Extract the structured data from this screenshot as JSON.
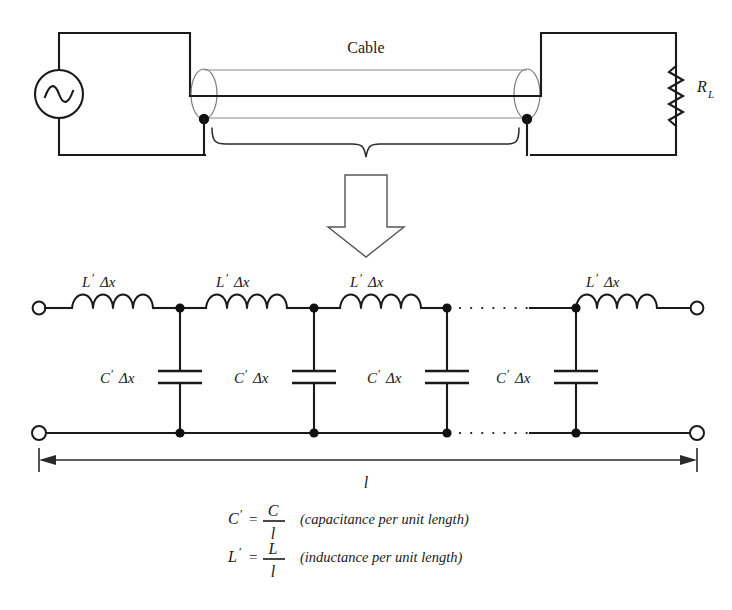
{
  "figure": {
    "title_top": "Cable"
  },
  "top_circuit": {
    "cable_label": "Cable",
    "source_name": "ac-source",
    "load_label_main": "R",
    "load_label_sub": "L"
  },
  "ladder": {
    "inductor_labels": [
      {
        "symbol": "L",
        "prime": "′",
        "delta": "Δx"
      },
      {
        "symbol": "L",
        "prime": "′",
        "delta": "Δx"
      },
      {
        "symbol": "L",
        "prime": "′",
        "delta": "Δx"
      },
      {
        "symbol": "L",
        "prime": "′",
        "delta": "Δx"
      }
    ],
    "capacitor_labels": [
      {
        "symbol": "C",
        "prime": "′",
        "delta": "Δx"
      },
      {
        "symbol": "C",
        "prime": "′",
        "delta": "Δx"
      },
      {
        "symbol": "C",
        "prime": "′",
        "delta": "Δx"
      },
      {
        "symbol": "C",
        "prime": "′",
        "delta": "Δx"
      }
    ],
    "length_label": "l"
  },
  "equations": [
    {
      "lhs_symbol": "C",
      "lhs_prime": "′",
      "equals": "=",
      "numerator": "C",
      "denominator": "l",
      "note": "(capacitance per unit length)"
    },
    {
      "lhs_symbol": "L",
      "lhs_prime": "′",
      "equals": "=",
      "numerator": "L",
      "denominator": "l",
      "note": "(inductance per unit length)"
    }
  ],
  "colors": {
    "ink": "#1a1a1a",
    "tube": "#8a8a8a",
    "background": "#ffffff"
  }
}
